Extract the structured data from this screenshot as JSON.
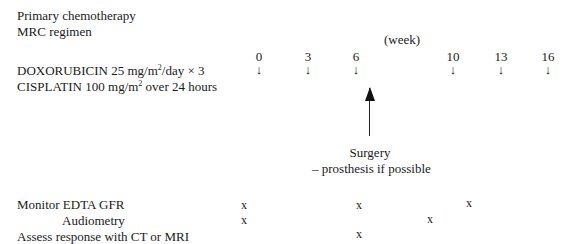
{
  "header": {
    "title_line1": "Primary chemotherapy",
    "title_line2": "MRC regimen"
  },
  "timeline": {
    "unit_label": "(week)",
    "weeks": [
      {
        "label": "0",
        "arrow": "↓"
      },
      {
        "label": "3",
        "arrow": "↓"
      },
      {
        "label": "6",
        "arrow": "↓"
      },
      {
        "label": "10",
        "arrow": "↓"
      },
      {
        "label": "13",
        "arrow": "↓"
      },
      {
        "label": "16",
        "arrow": "↓"
      }
    ]
  },
  "drugs": [
    {
      "name": "DOXORUBICIN",
      "dose_prefix": "25 mg/m",
      "dose_sup": "2",
      "dose_suffix": "/day × 3"
    },
    {
      "name": "CISPLATIN",
      "dose_prefix": "100 mg/m",
      "dose_sup": "2",
      "dose_suffix": " over 24 hours"
    }
  ],
  "surgery": {
    "label": "Surgery",
    "note": "–  prosthesis if possible"
  },
  "monitoring": [
    {
      "label": "Monitor EDTA GFR",
      "mark": "x",
      "weeks_marked": [
        "0",
        "6",
        "13"
      ]
    },
    {
      "label": "Audiometry",
      "mark": "x",
      "weeks_marked": [
        "0",
        "10"
      ]
    },
    {
      "label": "Assess response with CT or MRI",
      "mark": "x",
      "weeks_marked": [
        "6"
      ]
    }
  ]
}
